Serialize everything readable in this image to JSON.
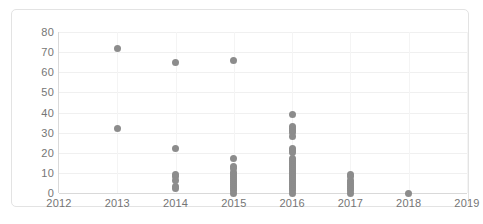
{
  "chart_data": {
    "type": "scatter",
    "title": "",
    "xlabel": "",
    "ylabel": "",
    "xlim": [
      2012,
      2019
    ],
    "ylim": [
      0,
      80
    ],
    "grid": true,
    "legend": false,
    "x_tick_labels": [
      "2012",
      "2013",
      "2014",
      "2015",
      "2016",
      "2017",
      "2018",
      "2019"
    ],
    "y_tick_labels": [
      "0",
      "10",
      "20",
      "30",
      "40",
      "50",
      "60",
      "70",
      "80"
    ],
    "y_ticks": [
      0,
      10,
      20,
      30,
      40,
      50,
      60,
      70,
      80
    ],
    "point_color": "#8c8c8c",
    "series": [
      {
        "name": "observations",
        "points": [
          {
            "x": 2013,
            "y": 72
          },
          {
            "x": 2013,
            "y": 32
          },
          {
            "x": 2014,
            "y": 65
          },
          {
            "x": 2014,
            "y": 22
          },
          {
            "x": 2014,
            "y": 9
          },
          {
            "x": 2014,
            "y": 8
          },
          {
            "x": 2014,
            "y": 6
          },
          {
            "x": 2014,
            "y": 3
          },
          {
            "x": 2014,
            "y": 2
          },
          {
            "x": 2015,
            "y": 66
          },
          {
            "x": 2015,
            "y": 17
          },
          {
            "x": 2015,
            "y": 13
          },
          {
            "x": 2015,
            "y": 12
          },
          {
            "x": 2015,
            "y": 10
          },
          {
            "x": 2015,
            "y": 9
          },
          {
            "x": 2015,
            "y": 8
          },
          {
            "x": 2015,
            "y": 7
          },
          {
            "x": 2015,
            "y": 6
          },
          {
            "x": 2015,
            "y": 5
          },
          {
            "x": 2015,
            "y": 4
          },
          {
            "x": 2015,
            "y": 3
          },
          {
            "x": 2015,
            "y": 2
          },
          {
            "x": 2015,
            "y": 1
          },
          {
            "x": 2015,
            "y": 0
          },
          {
            "x": 2016,
            "y": 39
          },
          {
            "x": 2016,
            "y": 33
          },
          {
            "x": 2016,
            "y": 32
          },
          {
            "x": 2016,
            "y": 31
          },
          {
            "x": 2016,
            "y": 30
          },
          {
            "x": 2016,
            "y": 28
          },
          {
            "x": 2016,
            "y": 22
          },
          {
            "x": 2016,
            "y": 21
          },
          {
            "x": 2016,
            "y": 20
          },
          {
            "x": 2016,
            "y": 17
          },
          {
            "x": 2016,
            "y": 16
          },
          {
            "x": 2016,
            "y": 15
          },
          {
            "x": 2016,
            "y": 14
          },
          {
            "x": 2016,
            "y": 13
          },
          {
            "x": 2016,
            "y": 12
          },
          {
            "x": 2016,
            "y": 11
          },
          {
            "x": 2016,
            "y": 10
          },
          {
            "x": 2016,
            "y": 9
          },
          {
            "x": 2016,
            "y": 8
          },
          {
            "x": 2016,
            "y": 7
          },
          {
            "x": 2016,
            "y": 6
          },
          {
            "x": 2016,
            "y": 5
          },
          {
            "x": 2016,
            "y": 4
          },
          {
            "x": 2016,
            "y": 3
          },
          {
            "x": 2016,
            "y": 2
          },
          {
            "x": 2016,
            "y": 1
          },
          {
            "x": 2016,
            "y": 0
          },
          {
            "x": 2017,
            "y": 9
          },
          {
            "x": 2017,
            "y": 8
          },
          {
            "x": 2017,
            "y": 6
          },
          {
            "x": 2017,
            "y": 5
          },
          {
            "x": 2017,
            "y": 4
          },
          {
            "x": 2017,
            "y": 3
          },
          {
            "x": 2017,
            "y": 2
          },
          {
            "x": 2017,
            "y": 1
          },
          {
            "x": 2017,
            "y": 0
          },
          {
            "x": 2018,
            "y": 0
          }
        ]
      }
    ]
  }
}
